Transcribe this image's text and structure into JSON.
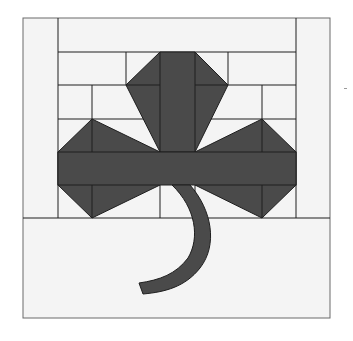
{
  "figure": {
    "colors": {
      "background": "#ffffff",
      "panel": "#f4f4f4",
      "fill": "#4a4a4a",
      "line": "#1e1e1e",
      "frame": "#6a6a6a"
    }
  }
}
